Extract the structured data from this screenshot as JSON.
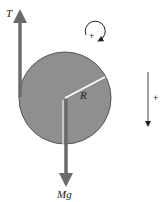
{
  "diagram": {
    "labels": {
      "tension": "T",
      "weight": "Mg",
      "radius": "R",
      "rotation_positive": "+",
      "linear_positive": "+"
    },
    "colors": {
      "disk_fill": "#8f8f8f",
      "disk_stroke": "#555555",
      "force_arrow": "#6b6b6b",
      "radius_line": "#ffffff",
      "small_arrow": "#222222"
    }
  }
}
